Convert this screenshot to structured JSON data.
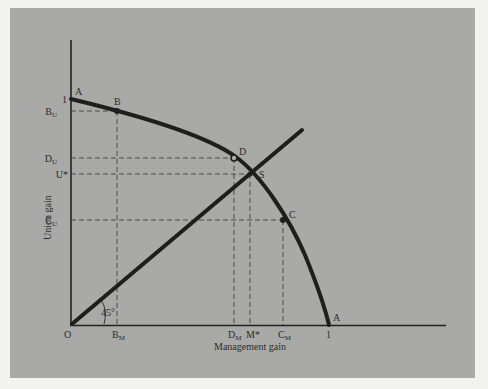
{
  "diagram": {
    "type": "bargaining-frontier",
    "x_axis_title": "Management gain",
    "y_axis_title": "Union gain",
    "origin_label": "O",
    "angle_label": "45°",
    "curve_end_labels": {
      "top": "A",
      "bottom": "A"
    },
    "axis_one_labels": {
      "x": "1",
      "y": "1"
    },
    "points": {
      "B": "B",
      "D": "D",
      "S": "S",
      "C": "C"
    },
    "x_ticks": {
      "B_M": {
        "main": "B",
        "sub": "M"
      },
      "D_M": {
        "main": "D",
        "sub": "M"
      },
      "M_star": "M*",
      "C_M": {
        "main": "C",
        "sub": "M"
      }
    },
    "y_ticks": {
      "B_U": {
        "main": "B",
        "sub": "U"
      },
      "D_U": {
        "main": "D",
        "sub": "U"
      },
      "U_star": "U*",
      "C_U": {
        "main": "C",
        "sub": "U"
      }
    },
    "colors": {
      "background": "#f2f2f0",
      "panel": "#a9a9a7",
      "ink": "#222222"
    }
  }
}
